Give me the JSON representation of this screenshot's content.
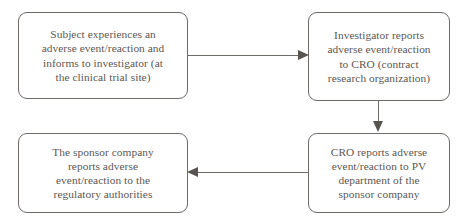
{
  "diagram": {
    "type": "flowchart",
    "background_color": "#ffffff",
    "text_color": "#5d5753",
    "border_color": "#6e6a68",
    "arrow_color": "#585450",
    "nodes": [
      {
        "id": "subject",
        "label": "Subject experiences an\nadverse event/reaction and\ninforms to investigator (at\nthe clinical trial site)",
        "shape": "rounded-rectangle"
      },
      {
        "id": "investigator",
        "label": "Investigator reports\nadverse event/reaction\nto CRO (contract\nresearch organization)",
        "shape": "rounded-rectangle"
      },
      {
        "id": "cro",
        "label": "CRO reports adverse\nevent/reaction to PV\ndepartment of the\nsponsor company",
        "shape": "rounded-rectangle"
      },
      {
        "id": "sponsor",
        "label": "The sponsor company\nreports adverse\nevent/reaction to the\nregulatory authorities",
        "shape": "rounded-rectangle"
      }
    ],
    "edges": [
      {
        "id": "subject-investigator",
        "from": "subject",
        "to": "investigator",
        "direction": "right"
      },
      {
        "id": "investigator-cro",
        "from": "investigator",
        "to": "cro",
        "direction": "down"
      },
      {
        "id": "cro-sponsor",
        "from": "cro",
        "to": "sponsor",
        "direction": "left"
      }
    ]
  }
}
